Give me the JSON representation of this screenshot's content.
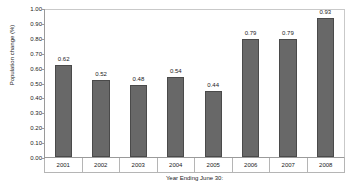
{
  "chart_data": {
    "type": "bar",
    "title": "",
    "xlabel": "Year Ending June 30:",
    "ylabel": "Population change (%)",
    "categories": [
      "2001",
      "2002",
      "2003",
      "2004",
      "2005",
      "2006",
      "2007",
      "2008"
    ],
    "values": [
      0.62,
      0.52,
      0.48,
      0.54,
      0.44,
      0.79,
      0.79,
      0.93
    ],
    "value_labels": [
      "0.62",
      "0.52",
      "0.48",
      "0.54",
      "0.44",
      "0.79",
      "0.79",
      "0.93"
    ],
    "ylim": [
      0.0,
      1.0
    ],
    "ytick_labels": [
      "1.00",
      "0.90",
      "0.80",
      "0.70",
      "0.60",
      "0.50",
      "0.40",
      "0.30",
      "0.20",
      "0.10",
      "0.00"
    ],
    "ytick_values": [
      1.0,
      0.9,
      0.8,
      0.7,
      0.6,
      0.5,
      0.4,
      0.3,
      0.2,
      0.1,
      0.0
    ],
    "grid": false,
    "legend": "none",
    "series_color": "#686868",
    "bar_outline_color": "#4a4a4a",
    "axis_color": "#9a9a9a",
    "background_color": "#ffffff"
  }
}
